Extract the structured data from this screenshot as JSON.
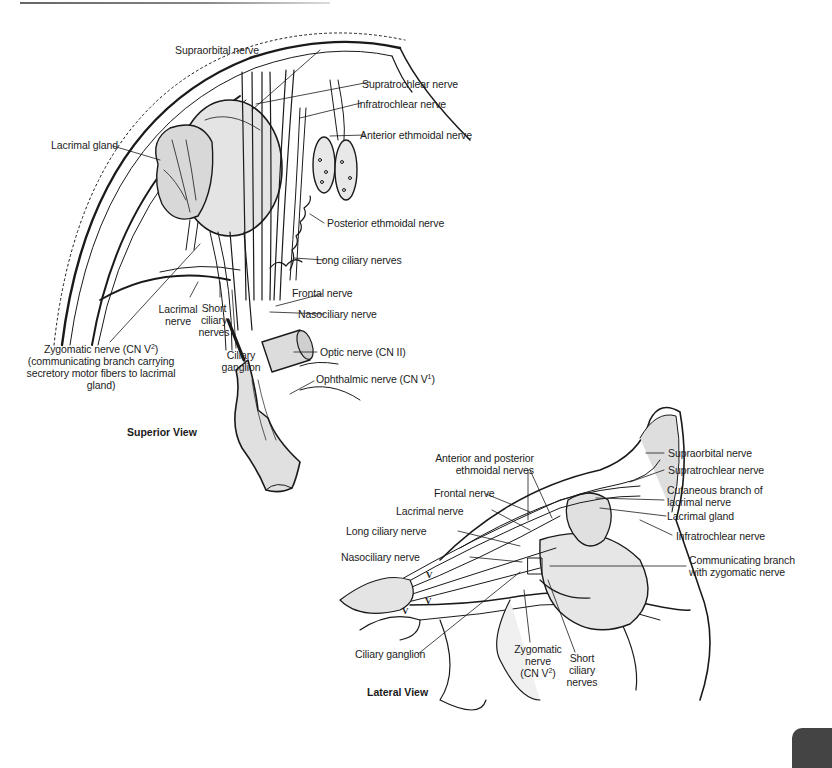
{
  "figure": {
    "superior_view": {
      "title": "Superior View",
      "labels": {
        "supraorbital_nerve": "Supraorbital nerve",
        "supratrochlear_nerve": "Supratrochlear nerve",
        "infratrochlear_nerve": "Infratrochlear nerve",
        "anterior_ethmoidal_nerve": "Anterior ethmoidal nerve",
        "lacrimal_gland": "Lacrimal gland",
        "posterior_ethmoidal_nerve": "Posterior ethmoidal nerve",
        "long_ciliary_nerves": "Long ciliary nerves",
        "frontal_nerve": "Frontal nerve",
        "nasociliary_nerve": "Nasociliary nerve",
        "lacrimal_nerve_line1": "Lacrimal",
        "lacrimal_nerve_line2": "nerve",
        "short_ciliary_line1": "Short",
        "short_ciliary_line2": "ciliary",
        "short_ciliary_line3": "nerves",
        "ciliary_ganglion_line1": "Ciliary",
        "ciliary_ganglion_line2": "ganglion",
        "optic_nerve": "Optic nerve (CN II)",
        "ophthalmic_nerve": "Ophthalmic nerve (CN V",
        "ophthalmic_nerve_sup": "1",
        "ophthalmic_nerve_close": ")",
        "zygomatic_line1": "Zygomatic nerve (CN V",
        "zygomatic_line1_sup": "2",
        "zygomatic_line1_close": ")",
        "zygomatic_line2": "(communicating branch carrying",
        "zygomatic_line3": "secretory motor fibers to lacrimal gland)"
      }
    },
    "lateral_view": {
      "title": "Lateral View",
      "labels": {
        "ant_post_ethmoidal_line1": "Anterior and posterior",
        "ant_post_ethmoidal_line2": "ethmoidal nerves",
        "frontal_nerve": "Frontal nerve",
        "lacrimal_nerve": "Lacrimal nerve",
        "long_ciliary_nerve": "Long ciliary nerve",
        "nasociliary_nerve": "Nasociliary nerve",
        "supraorbital_nerve": "Supraorbital nerve",
        "supratrochlear_nerve": "Supratrochlear nerve",
        "cutaneous_branch_line1": "Cutaneous branch of",
        "cutaneous_branch_line2": "lacrimal nerve",
        "lacrimal_gland": "Lacrimal gland",
        "infratrochlear_nerve": "Infratrochlear nerve",
        "communicating_line1": "Communicating branch",
        "communicating_line2": "with zygomatic nerve",
        "ciliary_ganglion": "Ciliary ganglion",
        "zygomatic_line1": "Zygomatic",
        "zygomatic_line2": "nerve",
        "zygomatic_line3": "(CN V",
        "zygomatic_line3_sup": "2",
        "zygomatic_line3_close": ")",
        "short_ciliary_line1": "Short",
        "short_ciliary_line2": "ciliary",
        "short_ciliary_line3": "nerves",
        "v1_mark": "V",
        "v1_sup": "1",
        "v2_mark": "V",
        "v2_sup": "2",
        "v3_mark": "V",
        "v3_sup": "3"
      }
    }
  },
  "colors": {
    "line": "#1a1a1a",
    "fill_light": "#ececec",
    "fill_mid": "#d6d6d6",
    "thumb_tab": "#444444"
  }
}
